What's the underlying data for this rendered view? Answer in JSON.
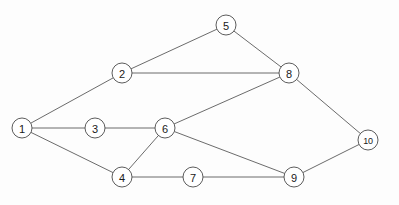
{
  "figure": {
    "kind": "undirected-graph-diagram",
    "width": 399,
    "height": 205,
    "background_color": "#fdfdfd",
    "node_fill_color": "#ffffff",
    "node_stroke_color": "#4a4a4a",
    "edge_color": "#5a5a5a",
    "label_color": "#1a1a1a",
    "node_radius": 10
  },
  "graph_data": {
    "type": "graph",
    "directed": false,
    "weighted": false,
    "node_count": 10,
    "edge_count": 13,
    "nodes": [
      {
        "id": "1",
        "label": "1",
        "x": 22,
        "y": 128
      },
      {
        "id": "2",
        "label": "2",
        "x": 122,
        "y": 73
      },
      {
        "id": "3",
        "label": "3",
        "x": 95,
        "y": 128
      },
      {
        "id": "4",
        "label": "4",
        "x": 122,
        "y": 177
      },
      {
        "id": "5",
        "label": "5",
        "x": 226,
        "y": 25
      },
      {
        "id": "6",
        "label": "6",
        "x": 165,
        "y": 128
      },
      {
        "id": "7",
        "label": "7",
        "x": 193,
        "y": 177
      },
      {
        "id": "8",
        "label": "8",
        "x": 289,
        "y": 73
      },
      {
        "id": "9",
        "label": "9",
        "x": 294,
        "y": 177
      },
      {
        "id": "10",
        "label": "10",
        "x": 368,
        "y": 140
      }
    ],
    "edges": [
      {
        "source": "1",
        "target": "2"
      },
      {
        "source": "1",
        "target": "3"
      },
      {
        "source": "1",
        "target": "4"
      },
      {
        "source": "2",
        "target": "5"
      },
      {
        "source": "2",
        "target": "8"
      },
      {
        "source": "3",
        "target": "6"
      },
      {
        "source": "4",
        "target": "6"
      },
      {
        "source": "4",
        "target": "7"
      },
      {
        "source": "5",
        "target": "8"
      },
      {
        "source": "6",
        "target": "8"
      },
      {
        "source": "6",
        "target": "9"
      },
      {
        "source": "7",
        "target": "9"
      },
      {
        "source": "8",
        "target": "10"
      },
      {
        "source": "9",
        "target": "10"
      }
    ]
  }
}
